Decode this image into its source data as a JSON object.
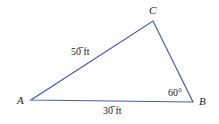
{
  "diagram": {
    "type": "triangle",
    "line_color": "#4a5aa8",
    "vertices": [
      {
        "name": "A",
        "x": 31,
        "y": 100
      },
      {
        "name": "B",
        "x": 193,
        "y": 102
      },
      {
        "name": "C",
        "x": 153,
        "y": 21
      }
    ],
    "labels": {
      "vertex_a": "A",
      "vertex_b": "B",
      "vertex_c": "C",
      "side_ac": "50̅ ft",
      "side_ab": "30̅ ft",
      "angle_b": "60°"
    }
  }
}
